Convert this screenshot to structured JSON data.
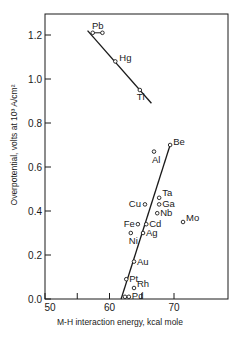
{
  "chart_data": {
    "type": "scatter",
    "title": "",
    "xlabel": "M-H interaction energy, kcal mole",
    "ylabel": "Overpotential, volts at 10³ A/cm²",
    "xlim": [
      50,
      78
    ],
    "ylim": [
      0.0,
      1.3
    ],
    "grid": false,
    "legend": null,
    "x_ticks": [
      50,
      55,
      60,
      65,
      70
    ],
    "x_tick_labels": [
      "50",
      "",
      "60",
      "",
      "70"
    ],
    "y_ticks": [
      0.0,
      0.2,
      0.4,
      0.6,
      0.8,
      1.0,
      1.2
    ],
    "y_tick_labels": [
      "0.0",
      "0.2",
      "0.4",
      "0.6",
      "0.8",
      "1.0",
      "1.2"
    ],
    "points": [
      {
        "label": "Pb",
        "x": 57.4,
        "y": 1.21
      },
      {
        "label": "Pb",
        "x": 58.9,
        "y": 1.21
      },
      {
        "label": "Hg",
        "x": 60.9,
        "y": 1.08
      },
      {
        "label": "Tl",
        "x": 64.7,
        "y": 0.95
      },
      {
        "label": "Be",
        "x": 69.4,
        "y": 0.7
      },
      {
        "label": "Al",
        "x": 66.9,
        "y": 0.67
      },
      {
        "label": "Ta",
        "x": 67.7,
        "y": 0.46
      },
      {
        "label": "Ga",
        "x": 67.7,
        "y": 0.43
      },
      {
        "label": "Cu",
        "x": 65.5,
        "y": 0.43
      },
      {
        "label": "Nb",
        "x": 67.4,
        "y": 0.39
      },
      {
        "label": "Mo",
        "x": 71.4,
        "y": 0.35
      },
      {
        "label": "Fe",
        "x": 64.4,
        "y": 0.34
      },
      {
        "label": "Cd",
        "x": 65.7,
        "y": 0.34
      },
      {
        "label": "Ag",
        "x": 65.2,
        "y": 0.3
      },
      {
        "label": "Ni",
        "x": 63.3,
        "y": 0.3
      },
      {
        "label": "Au",
        "x": 63.8,
        "y": 0.17
      },
      {
        "label": "Pt",
        "x": 62.6,
        "y": 0.09
      },
      {
        "label": "Rh",
        "x": 63.8,
        "y": 0.05
      },
      {
        "label": "Pd",
        "x": 62.4,
        "y": 0.01
      },
      {
        "label": "Pd",
        "x": 63.0,
        "y": 0.01
      }
    ],
    "trend_lines": [
      {
        "name": "descending",
        "from": {
          "x": 56.6,
          "y": 1.22
        },
        "to": {
          "x": 66.5,
          "y": 0.89
        }
      },
      {
        "name": "ascending",
        "from": {
          "x": 61.8,
          "y": 0.0
        },
        "to": {
          "x": 69.4,
          "y": 0.7
        }
      }
    ]
  },
  "axes": {
    "x_title": "M-H interaction energy, kcal mole",
    "y_title": "Overpotential, volts at 10³ A/cm²"
  }
}
